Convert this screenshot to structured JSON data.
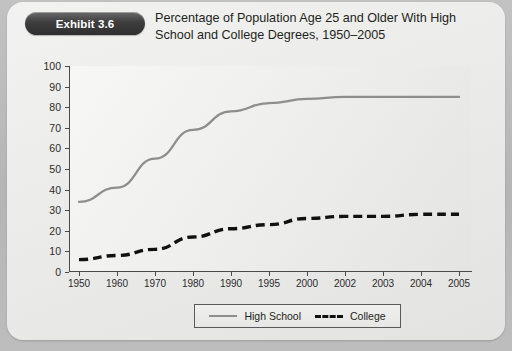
{
  "exhibit": {
    "badge_label": "Exhibit 3.6",
    "title": "Percentage of Population Age 25 and Older With High School and College Degrees, 1950–2005"
  },
  "legend": {
    "items": [
      {
        "label": "High School",
        "style": "solid",
        "color": "#8e8e8e"
      },
      {
        "label": "College",
        "style": "dashed",
        "color": "#111111"
      }
    ]
  },
  "axis": {
    "y_ticks": [
      "100",
      "90",
      "80",
      "70",
      "60",
      "50",
      "40",
      "30",
      "20",
      "10",
      "0"
    ],
    "x_ticks": [
      "1950",
      "1960",
      "1970",
      "1980",
      "1990",
      "1995",
      "2000",
      "2002",
      "2003",
      "2004",
      "2005"
    ]
  },
  "chart_data": {
    "type": "line",
    "title": "Percentage of Population Age 25 and Older With High School and College Degrees, 1950–2005",
    "xlabel": "",
    "ylabel": "",
    "categories": [
      "1950",
      "1960",
      "1970",
      "1980",
      "1990",
      "1995",
      "2000",
      "2002",
      "2003",
      "2004",
      "2005"
    ],
    "series": [
      {
        "name": "High School",
        "style": "solid",
        "color": "#8e8e8e",
        "values": [
          34,
          41,
          55,
          69,
          78,
          82,
          84,
          85,
          85,
          85,
          85
        ]
      },
      {
        "name": "College",
        "style": "dashed",
        "color": "#111111",
        "values": [
          6,
          8,
          11,
          17,
          21,
          23,
          26,
          27,
          27,
          28,
          28
        ]
      }
    ],
    "ylim": [
      0,
      100
    ],
    "ytick_step": 10,
    "grid": false,
    "legend_position": "bottom"
  }
}
